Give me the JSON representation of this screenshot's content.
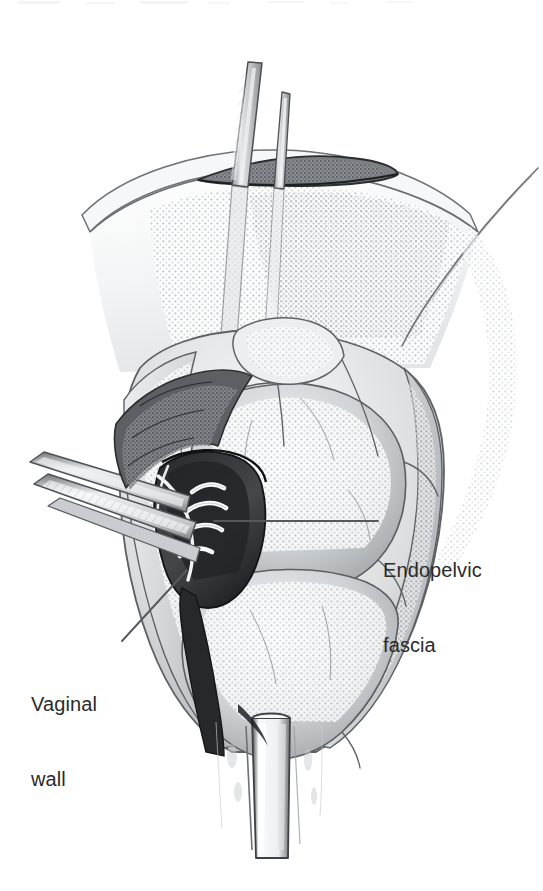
{
  "figure": {
    "kind": "medical-surgical-illustration",
    "style": "pencil-and-halftone-line-drawing",
    "background_color": "#ffffff",
    "ink_color": "#2b2b2b",
    "width": 543,
    "height": 891,
    "procedure_scene": "Retropubic surgical exposure with retractors, incision and suture placement"
  },
  "annotations": [
    {
      "id": "endopelvic-fascia",
      "text_lines": [
        "Endopelvic",
        "fascia"
      ],
      "line1": "Endopelvic",
      "line2": "fascia",
      "text_x": 383,
      "text_y": 508,
      "leader": {
        "type": "straight",
        "x1": 378,
        "y1": 521,
        "x2": 214,
        "y2": 521
      }
    },
    {
      "id": "vaginal-wall",
      "text_lines": [
        "Vaginal",
        "wall"
      ],
      "line1": "Vaginal",
      "line2": "wall",
      "text_x": 31,
      "text_y": 642,
      "leader": {
        "type": "straight",
        "x1": 122,
        "y1": 641,
        "x2": 187,
        "y2": 570
      }
    }
  ],
  "scene_elements": [
    {
      "name": "upper-instrument-shaft-left",
      "description": "Long narrow instrument shaft descending from top of frame into incision"
    },
    {
      "name": "upper-instrument-shaft-right",
      "description": "Second thinner instrument shaft parallel to the first"
    },
    {
      "name": "incision-slit",
      "description": "Dark horizontal elliptical incision opening near top of tissue dome"
    },
    {
      "name": "abdominal-wall-dome",
      "description": "Large stippled tissue dome spanning upper half of illustration"
    },
    {
      "name": "left-retractor-blade",
      "description": "Angled retractor blade entering from left margin"
    },
    {
      "name": "suture-bundle",
      "description": "Bright white suture strands crossing the dark surgical pocket"
    },
    {
      "name": "endopelvic-fascia-structure",
      "description": "Fascial tissue layer at the right of the surgical pocket"
    },
    {
      "name": "vaginal-wall-structure",
      "description": "Vaginal wall tissue below and left of the suture bundle"
    },
    {
      "name": "bottom-retractor",
      "description": "Vertical retractor blade extending to the bottom of the frame"
    },
    {
      "name": "upper-right-diagonal-edge",
      "description": "Long diagonal tissue edge line in upper right quadrant"
    }
  ],
  "colors": {
    "background": "#ffffff",
    "label_text": "#2b2b2b",
    "leader_line": "#55585c",
    "ink_dark": "#1d1d1d",
    "ink_mid": "#6f7276",
    "tone_light": "#d7d9db",
    "tone_mid": "#b4b7ba",
    "tone_deep": "#7d8084"
  }
}
